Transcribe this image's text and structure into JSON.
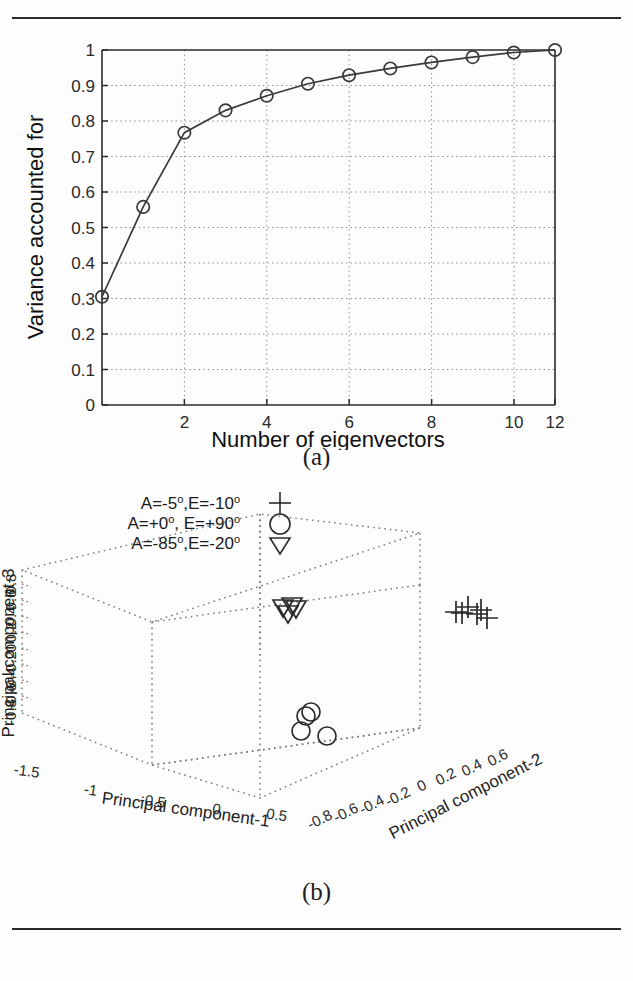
{
  "page": {
    "rule_top": "horizontal-rule",
    "rule_bottom": "horizontal-rule"
  },
  "figure_a": {
    "caption": "(a)"
  },
  "figure_b": {
    "caption": "(b)"
  },
  "chart_data": [
    {
      "type": "line",
      "title": "",
      "xlabel": "Number of eigenvectors",
      "ylabel": "Variance accounted for",
      "xlim": [
        1,
        12
      ],
      "ylim": [
        0,
        1
      ],
      "grid": true,
      "marker": "circle",
      "xticks": [
        "2",
        "4",
        "6",
        "8",
        "10",
        "12"
      ],
      "xtick_values": [
        2,
        4,
        6,
        8,
        10,
        12
      ],
      "yticks": [
        "0",
        "0.1",
        "0.2",
        "0.3",
        "0.4",
        "0.5",
        "0.6",
        "0.7",
        "0.8",
        "0.9",
        "1"
      ],
      "ytick_values": [
        0,
        0.1,
        0.2,
        0.3,
        0.4,
        0.5,
        0.6,
        0.7,
        0.8,
        0.9,
        1
      ],
      "x": [
        1,
        2,
        3,
        4,
        5,
        6,
        7,
        8,
        9,
        10,
        11,
        12
      ],
      "values": [
        0.305,
        0.558,
        0.767,
        0.83,
        0.871,
        0.905,
        0.929,
        0.948,
        0.965,
        0.98,
        0.993,
        1.0
      ]
    },
    {
      "type": "scatter",
      "projection": "3d",
      "title": "",
      "xlabel": "Principal component-1",
      "ylabel": "Principal component-2",
      "zlabel": "Principal component-3",
      "xticks": [
        "-1.5",
        "-1",
        "-0.5",
        "0",
        "0.5"
      ],
      "yticks": [
        "-0.8",
        "-0.6",
        "-0.4",
        "-0.2",
        "0",
        "0.2",
        "0.4",
        "0.6"
      ],
      "zticks": [
        "0.8",
        "0.6",
        "0.4",
        "0.2",
        "0",
        "-0.2",
        "-0.4",
        "-0.6",
        "-0.8"
      ],
      "legend_position": "above-left",
      "legend": [
        {
          "label": "A=-5",
          "label2": ",E=-10",
          "deg1": "o",
          "deg2": "o",
          "marker": "plus"
        },
        {
          "label": "A=+0",
          "label2": ", E=+90",
          "deg1": "o",
          "deg2": "o",
          "marker": "circle"
        },
        {
          "label": "A=-85",
          "label2": ",E=-20",
          "deg1": "o",
          "deg2": "o",
          "marker": "triangle-down"
        }
      ],
      "series": [
        {
          "name": "A=-5,E=-10",
          "marker": "plus",
          "points_px": [
            [
              456,
              612
            ],
            [
              468,
              607
            ],
            [
              477,
              614
            ],
            [
              487,
              618
            ],
            [
              462,
              613
            ],
            [
              481,
              610
            ]
          ]
        },
        {
          "name": "A=+0,E=+90",
          "marker": "circle",
          "points_px": [
            [
              306,
              716
            ],
            [
              311,
              712
            ],
            [
              301,
              731
            ],
            [
              327,
              736
            ]
          ]
        },
        {
          "name": "A=-85,E=-20",
          "marker": "triangle-down",
          "points_px": [
            [
              283,
              608
            ],
            [
              292,
              606
            ],
            [
              288,
              614
            ],
            [
              296,
              609
            ]
          ]
        }
      ]
    }
  ]
}
